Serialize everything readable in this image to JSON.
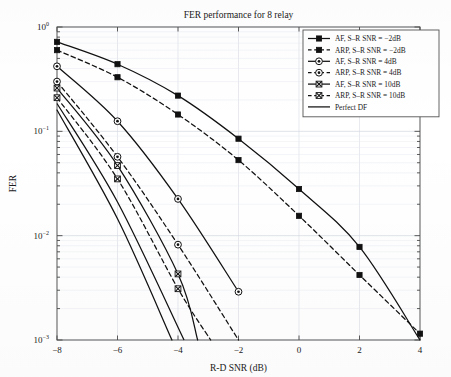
{
  "chart_data": {
    "type": "line",
    "title": "FER performance for 8 relay",
    "xlabel": "R-D SNR (dB)",
    "ylabel": "FER",
    "xlim": [
      -8,
      4
    ],
    "ylim": [
      0.001,
      1
    ],
    "yscale": "log",
    "xticks": [
      -8,
      -6,
      -4,
      -2,
      0,
      2,
      4
    ],
    "xticklabels": [
      "-8",
      "-6",
      "-4",
      "-2",
      "0",
      "2",
      "4"
    ],
    "yticks": [
      1,
      0.1,
      0.01,
      0.001
    ],
    "yticklabels": [
      "10^0",
      "10^-1",
      "10^-2",
      "10^-3"
    ],
    "grid": true,
    "legend_position": "upper right",
    "series": [
      {
        "name": "AF, S-R SNR = -2dB",
        "style": "solid",
        "marker": "filled-square",
        "color": "#111111",
        "x": [
          -8,
          -6,
          -4,
          -2,
          0,
          2,
          4
        ],
        "y": [
          0.72,
          0.44,
          0.22,
          0.085,
          0.028,
          0.0078,
          0.001
        ]
      },
      {
        "name": "ARP, S-R SNR = -2dB",
        "style": "dashed",
        "marker": "filled-square",
        "color": "#111111",
        "x": [
          -8,
          -6,
          -4,
          -2,
          0,
          2,
          4
        ],
        "y": [
          0.6,
          0.33,
          0.145,
          0.053,
          0.0155,
          0.0042,
          0.00115
        ]
      },
      {
        "name": "AF, S-R SNR = 4dB",
        "style": "solid",
        "marker": "circle-dot",
        "color": "#111111",
        "x": [
          -8,
          -6,
          -4,
          -2
        ],
        "y": [
          0.42,
          0.125,
          0.0225,
          0.0029
        ]
      },
      {
        "name": "ARP, S-R SNR = 4dB",
        "style": "dashed",
        "marker": "circle-dot",
        "color": "#111111",
        "x": [
          -8,
          -6,
          -4,
          -2
        ],
        "y": [
          0.3,
          0.057,
          0.0082,
          0.001
        ]
      },
      {
        "name": "AF, S-R SNR = 10dB",
        "style": "solid",
        "marker": "x-square",
        "color": "#111111",
        "x": [
          -8,
          -6,
          -4,
          -3.35
        ],
        "y": [
          0.26,
          0.047,
          0.0043,
          0.001
        ]
      },
      {
        "name": "ARP, S-R SNR = 10dB",
        "style": "dashed",
        "marker": "x-square",
        "color": "#111111",
        "x": [
          -8,
          -6,
          -4,
          -2.92
        ],
        "y": [
          0.21,
          0.035,
          0.0031,
          0.001
        ]
      },
      {
        "name": "Perfect DF",
        "style": "solid",
        "marker": "none",
        "color": "#111111",
        "x": [
          -8,
          -6,
          -4.2
        ],
        "y": [
          0.16,
          0.0145,
          0.001
        ]
      }
    ],
    "extra_solid_lines": [
      {
        "name": "perfect-df-companion",
        "x": [
          -8,
          -6,
          -3.8
        ],
        "y": [
          0.185,
          0.021,
          0.001
        ]
      }
    ]
  }
}
